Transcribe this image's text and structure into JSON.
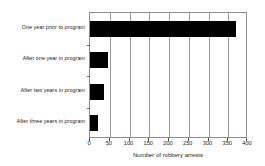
{
  "chart_data": {
    "type": "bar",
    "orientation": "horizontal",
    "title": "",
    "xlabel": "Number of robbery arrests",
    "ylabel": "",
    "categories": [
      "One year prior to program",
      "After one year in program",
      "After two years in program",
      "After three years in program"
    ],
    "values": [
      370,
      45,
      35,
      20
    ],
    "xlim": [
      0,
      400
    ],
    "xticks": [
      0,
      50,
      100,
      150,
      200,
      250,
      300,
      350,
      400
    ],
    "xtick_labels": [
      "0",
      "50",
      "100",
      "150",
      "200",
      "250",
      "300",
      "350",
      "400"
    ],
    "grid": "vertical",
    "legend": null,
    "bar_color": "#000000",
    "frame_color": "#8d8d8d",
    "gridline_color": "#9a9a9a",
    "background_color": "#ffffff"
  }
}
